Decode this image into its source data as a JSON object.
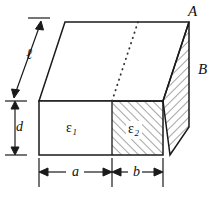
{
  "figure": {
    "type": "technical-line-drawing",
    "background_color": "#ffffff",
    "line_color": "#1a1a1a",
    "hatch_color": "#555555",
    "vertex_labels": [
      {
        "name": "A",
        "text": "A",
        "x": 188,
        "y": 4
      },
      {
        "name": "B",
        "text": "B",
        "x": 198,
        "y": 62
      }
    ],
    "region_labels": [
      {
        "name": "epsilon-1",
        "symbol": "ε",
        "subscript": "1",
        "x": 66,
        "y": 121,
        "hatched": false
      },
      {
        "name": "epsilon-2",
        "symbol": "ε",
        "subscript": "2",
        "x": 128,
        "y": 121,
        "hatched": true
      }
    ],
    "dimension_labels": [
      {
        "name": "length-ell",
        "text": "ℓ",
        "x": 26,
        "y": 47,
        "orientation": "oblique"
      },
      {
        "name": "depth-d",
        "text": "d",
        "x": 16,
        "y": 120,
        "orientation": "vertical"
      },
      {
        "name": "width-a",
        "text": "a",
        "x": 72,
        "y": 165,
        "orientation": "horizontal"
      },
      {
        "name": "width-b",
        "text": "b",
        "x": 133,
        "y": 165,
        "orientation": "horizontal"
      }
    ],
    "geometry": {
      "front_face": {
        "left": 39,
        "right": 163,
        "top": 101,
        "bottom": 155
      },
      "divider_x": 112,
      "oblique_offset": {
        "dx": 26,
        "dy": -79
      },
      "back_top_left": {
        "x": 65,
        "y": 22
      },
      "back_top_right": {
        "x": 189,
        "y": 22
      },
      "side_bottom": {
        "x": 170,
        "y": 155
      },
      "dotted_line": {
        "x1": 138,
        "y1": 22,
        "x2": 112,
        "y2": 101
      }
    }
  }
}
